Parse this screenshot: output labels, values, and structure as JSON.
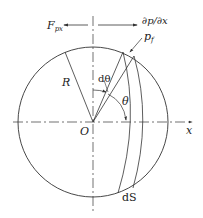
{
  "diagram": {
    "labels": {
      "force": "F",
      "force_sub": "px",
      "gradient": "∂p/∂x",
      "pressure": "p",
      "pressure_sub": "f",
      "radius": "R",
      "dtheta": "dθ",
      "theta": "θ",
      "origin": "O",
      "x_axis": "x",
      "ds": "dS"
    },
    "colors": {
      "stroke": "#333333",
      "background": "#ffffff"
    }
  }
}
